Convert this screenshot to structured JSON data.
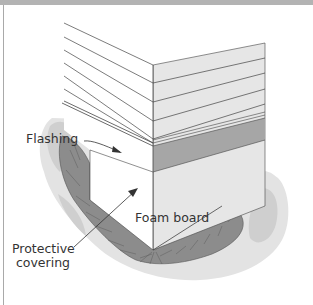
{
  "diagram": {
    "title": "",
    "labels": {
      "flashing": "Flashing",
      "foam_board": "Foam board",
      "protective_covering_line1": "Protective",
      "protective_covering_line2": "covering"
    },
    "colors": {
      "top_bar": "#b3b3b3",
      "left_face": "#ffffff",
      "right_face": "#e6e6e6",
      "foam_band": "#a6a6a6",
      "ground": "#e3e3e3",
      "ground_patch": "#cfcfcf",
      "trench": "#8c8c8c",
      "lines": "#333333"
    }
  }
}
